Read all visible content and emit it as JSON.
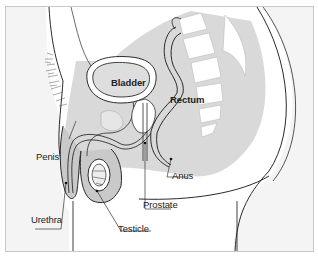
{
  "diagram": {
    "type": "anatomical cross-section",
    "labels": {
      "bladder": "Bladder",
      "rectum": "Rectum",
      "penis": "Penis",
      "urethra": "Urethra",
      "testicle": "Testicle",
      "prostate": "Prostate",
      "anus": "Anus"
    },
    "colors": {
      "background": "#f4f4f4",
      "body_fill": "#ffffff",
      "organ_gray": "#c9c9c9",
      "light_gray": "#dedede",
      "outline": "#2a2a2a",
      "frame_border": "#c8c8c8"
    }
  }
}
